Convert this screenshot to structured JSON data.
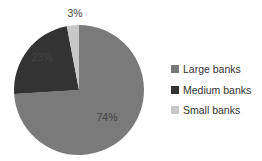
{
  "chart_data": {
    "type": "pie",
    "title": "",
    "categories": [
      "Large banks",
      "Medium banks",
      "Small banks"
    ],
    "values": [
      74,
      23,
      3
    ],
    "labels": [
      "74%",
      "23%",
      "3%"
    ],
    "colors": [
      "#7a7a7a",
      "#333333",
      "#c8c8c8"
    ],
    "start_angle_deg": 0,
    "direction": "clockwise",
    "legend_position": "right"
  },
  "legend": {
    "items": [
      {
        "label": "Large banks",
        "color": "#7a7a7a"
      },
      {
        "label": "Medium banks",
        "color": "#333333"
      },
      {
        "label": "Small banks",
        "color": "#c8c8c8"
      }
    ]
  }
}
